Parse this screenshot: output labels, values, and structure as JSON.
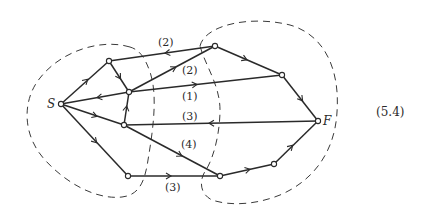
{
  "figure": {
    "equation_number": "(5.4)",
    "source_label": "S",
    "sink_label": "F"
  },
  "nodes": [
    {
      "id": "S",
      "label": "S",
      "x": 61,
      "y": 104
    },
    {
      "id": "A",
      "label": "",
      "x": 109,
      "y": 61
    },
    {
      "id": "B",
      "label": "",
      "x": 129,
      "y": 92
    },
    {
      "id": "C",
      "label": "",
      "x": 124,
      "y": 125
    },
    {
      "id": "D",
      "label": "",
      "x": 128,
      "y": 176
    },
    {
      "id": "T",
      "label": "",
      "x": 215,
      "y": 46
    },
    {
      "id": "R",
      "label": "",
      "x": 282,
      "y": 75
    },
    {
      "id": "F",
      "label": "F",
      "x": 318,
      "y": 121
    },
    {
      "id": "E",
      "label": "",
      "x": 220,
      "y": 176
    },
    {
      "id": "G",
      "label": "",
      "x": 274,
      "y": 164
    }
  ],
  "edges": [
    {
      "from": "S",
      "to": "A",
      "label": ""
    },
    {
      "from": "A",
      "to": "B",
      "label": ""
    },
    {
      "from": "B",
      "to": "S",
      "label": ""
    },
    {
      "from": "C",
      "to": "B",
      "label": ""
    },
    {
      "from": "S",
      "to": "C",
      "label": ""
    },
    {
      "from": "S",
      "to": "D",
      "label": ""
    },
    {
      "from": "T",
      "to": "A",
      "label": "(2)"
    },
    {
      "from": "B",
      "to": "T",
      "label": "(2)"
    },
    {
      "from": "B",
      "to": "R",
      "label": "(1)"
    },
    {
      "from": "T",
      "to": "R",
      "label": ""
    },
    {
      "from": "R",
      "to": "F",
      "label": ""
    },
    {
      "from": "F",
      "to": "C",
      "label": "(3)"
    },
    {
      "from": "C",
      "to": "E",
      "label": "(4)"
    },
    {
      "from": "D",
      "to": "E",
      "label": "(3)"
    },
    {
      "from": "E",
      "to": "G",
      "label": ""
    },
    {
      "from": "G",
      "to": "F",
      "label": ""
    }
  ],
  "edge_labels": {
    "TA": "(2)",
    "BT": "(2)",
    "BR": "(1)",
    "FC": "(3)",
    "CE": "(4)",
    "DE": "(3)"
  },
  "regions": [
    {
      "name": "source-side-cut-region",
      "style": "dashed"
    },
    {
      "name": "sink-side-cut-region",
      "style": "dashed"
    }
  ]
}
